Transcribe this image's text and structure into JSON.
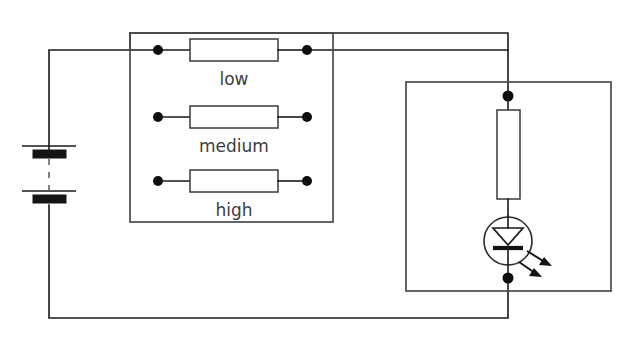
{
  "diagram": {
    "background_color": "#ffffff",
    "line_color": "#1a1a1a",
    "enclosure_color": "#4a4a4a",
    "label_color": "#3d3d3d"
  },
  "resistor_bank": {
    "name": "resistor-selection-box",
    "resistors": [
      {
        "label": "low",
        "connected": true,
        "left_terminal": "junction-dot",
        "right_terminal": "junction-dot"
      },
      {
        "label": "medium",
        "connected": false,
        "left_terminal": "junction-dot",
        "right_terminal": "junction-dot"
      },
      {
        "label": "high",
        "connected": false,
        "left_terminal": "junction-dot",
        "right_terminal": "junction-dot"
      }
    ]
  },
  "battery": {
    "name": "battery-symbol",
    "cells": 2,
    "dashed_link": true
  },
  "led_module": {
    "name": "led-enclosure",
    "series_resistor": "vertical-resistor",
    "led": "light-emitting-diode",
    "emission_arrows": 2,
    "top_terminal": "junction-dot",
    "bottom_terminal": "junction-dot"
  },
  "icons": {
    "resistor": "resistor-icon",
    "led": "led-icon",
    "battery": "battery-icon",
    "junction": "junction-dot-icon",
    "emission": "light-emission-arrow-icon"
  }
}
